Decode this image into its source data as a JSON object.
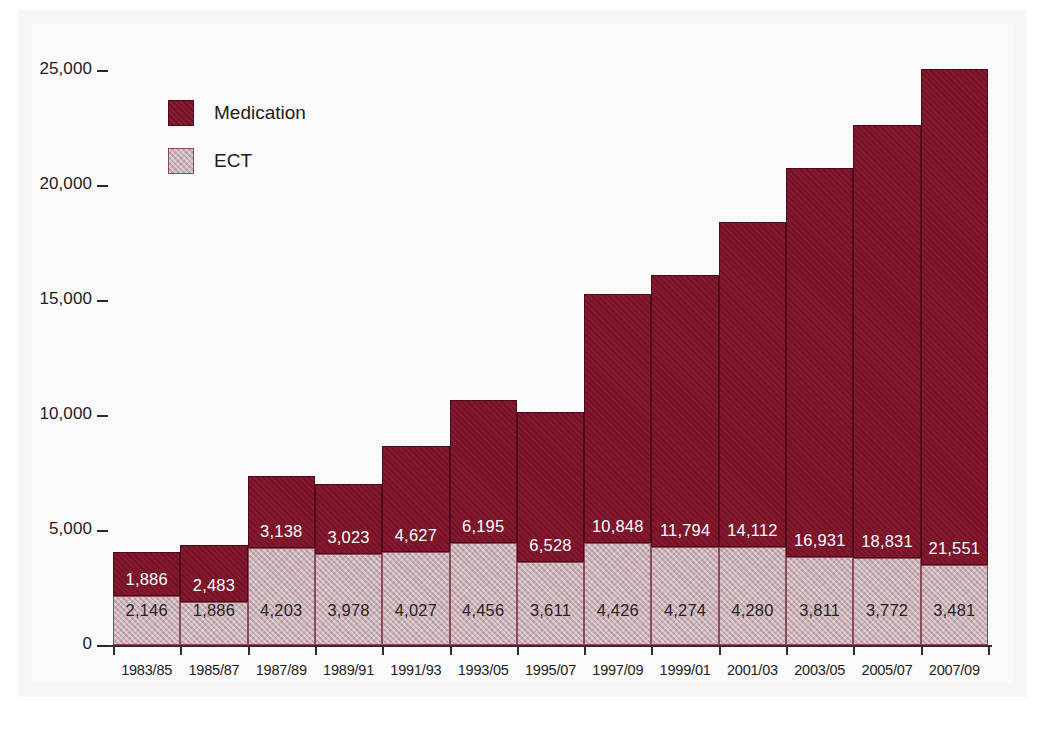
{
  "chart_data": {
    "type": "bar",
    "stacked": true,
    "title": "",
    "xlabel": "",
    "ylabel": "",
    "ylim": [
      0,
      25000
    ],
    "grid": false,
    "legend_position": "top-left",
    "y_ticks": [
      "0",
      "5,000",
      "10,000",
      "15,000",
      "20,000",
      "25,000"
    ],
    "y_tick_values": [
      0,
      5000,
      10000,
      15000,
      20000,
      25000
    ],
    "categories": [
      "1983/85",
      "1985/87",
      "1987/89",
      "1989/91",
      "1991/93",
      "1993/05",
      "1995/07",
      "1997/09",
      "1999/01",
      "2001/03",
      "2003/05",
      "2005/07",
      "2007/09"
    ],
    "series": [
      {
        "name": "ECT",
        "color": "#c4aab0",
        "values": [
          2146,
          1886,
          4203,
          3978,
          4027,
          4456,
          3611,
          4426,
          4274,
          4280,
          3811,
          3772,
          3481
        ],
        "labels": [
          "2,146",
          "1,886",
          "4,203",
          "3,978",
          "4,027",
          "4,456",
          "3,611",
          "4,426",
          "4,274",
          "4,280",
          "3,811",
          "3,772",
          "3,481"
        ]
      },
      {
        "name": "Medication",
        "color": "#7d1228",
        "values": [
          1886,
          2483,
          3138,
          3023,
          4627,
          6195,
          6528,
          10848,
          11794,
          14112,
          16931,
          18831,
          21551
        ],
        "labels": [
          "1,886",
          "2,483",
          "3,138",
          "3,023",
          "4,627",
          "6,195",
          "6,528",
          "10,848",
          "11,794",
          "14,112",
          "16,931",
          "18,831",
          "21,551"
        ]
      }
    ]
  },
  "legend": {
    "items": [
      {
        "label": "Medication",
        "color": "#7d1228"
      },
      {
        "label": "ECT",
        "color": "#c4aab0"
      }
    ]
  },
  "colors": {
    "medication": "#7d1228",
    "ect": "#c4aab0",
    "axis": "#3a2a2c",
    "paper": "#fbfafa",
    "text": "#231c1c"
  }
}
